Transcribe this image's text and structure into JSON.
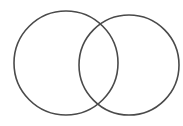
{
  "diagram": {
    "type": "venn",
    "background": "#ffffff",
    "stroke_color": "#4a4a4a",
    "stroke_width": 1.6,
    "sets": [
      {
        "id": "left",
        "cx": 66,
        "cy": 63,
        "r": 52
      },
      {
        "id": "right",
        "cx": 129,
        "cy": 65,
        "r": 50
      }
    ],
    "labels": []
  }
}
